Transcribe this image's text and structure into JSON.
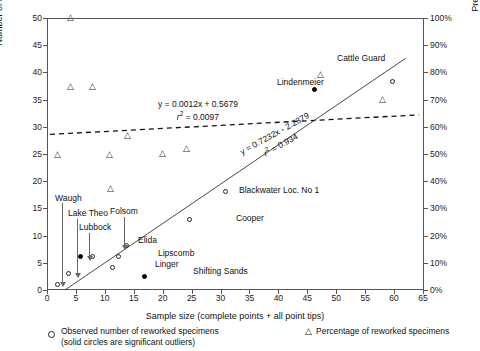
{
  "chart_data": {
    "type": "scatter",
    "title": "",
    "xlabel": "Sample size (complete points + all point tips)",
    "ylabel_left": "Number of reworked specimens",
    "ylabel_right": "Predicted percentage of reworked points",
    "xlim": [
      0,
      65
    ],
    "ylim_left": [
      0,
      50
    ],
    "ylim_right": [
      0,
      100
    ],
    "grid": false,
    "xticks": [
      "0",
      "5",
      "10",
      "15",
      "20",
      "25",
      "30",
      "35",
      "40",
      "45",
      "50",
      "55",
      "60",
      "65"
    ],
    "yticks_left": [
      "0",
      "5",
      "10",
      "15",
      "20",
      "25",
      "30",
      "35",
      "40",
      "45",
      "50"
    ],
    "yticks_right": [
      "0%",
      "10%",
      "20%",
      "30%",
      "40%",
      "50%",
      "60%",
      "70%",
      "80%",
      "90%",
      "100%"
    ],
    "series": [
      {
        "name": "Observed number of reworked specimens",
        "marker": "open-circle",
        "points": [
          {
            "x": 1.9,
            "y": 1.0,
            "label": "Waugh",
            "solid": false
          },
          {
            "x": 3.8,
            "y": 3.1,
            "label": "Lake Theo",
            "solid": false
          },
          {
            "x": 5.8,
            "y": 6.1,
            "label": "Lubbock",
            "solid": true
          },
          {
            "x": 7.8,
            "y": 6.1,
            "label": "Elida",
            "solid": false
          },
          {
            "x": 11.3,
            "y": 4.1,
            "label": "Linger",
            "solid": false
          },
          {
            "x": 12.3,
            "y": 6.2,
            "label": "Lipscomb",
            "solid": false
          },
          {
            "x": 13.7,
            "y": 8.2,
            "label": "Folsom",
            "solid": false
          },
          {
            "x": 16.8,
            "y": 2.5,
            "label": "Shifting Sands",
            "solid": true
          },
          {
            "x": 24.7,
            "y": 13.0,
            "label": "Cooper",
            "solid": false
          },
          {
            "x": 30.9,
            "y": 18.1,
            "label": "Blackwater Loc. No 1",
            "solid": false
          },
          {
            "x": 46.2,
            "y": 36.8,
            "label": "Lindenmeier",
            "solid": true
          },
          {
            "x": 59.8,
            "y": 38.3,
            "label": "Cattle Guard",
            "solid": false
          }
        ]
      },
      {
        "name": "Percentage of reworked specimens",
        "marker": "open-triangle",
        "points": [
          {
            "x": 4.0,
            "y": 50.0
          },
          {
            "x": 4.0,
            "y": 37.4
          },
          {
            "x": 7.8,
            "y": 37.4
          },
          {
            "x": 1.9,
            "y": 24.9
          },
          {
            "x": 10.8,
            "y": 24.9
          },
          {
            "x": 10.9,
            "y": 18.6
          },
          {
            "x": 13.9,
            "y": 28.4
          },
          {
            "x": 24.2,
            "y": 26.0
          },
          {
            "x": 20.0,
            "y": 25.0
          },
          {
            "x": 47.2,
            "y": 39.6
          },
          {
            "x": 58.0,
            "y": 35.0
          }
        ]
      }
    ],
    "trendlines": [
      {
        "name": "percentage-trend",
        "style": "dashed",
        "equation": "y = 0.0012x + 0.5679",
        "r2_label": "r",
        "r2_sup": "2",
        "r2_value": " = 0.0097",
        "slope": 0.0012,
        "intercept": 0.5679,
        "r2": 0.0097
      },
      {
        "name": "count-trend",
        "style": "solid",
        "equation": "y = 0.7232x - 2.2379",
        "r2_label": "r",
        "r2_sup": "2",
        "r2_value": " = 0.934",
        "slope": 0.7232,
        "intercept": -2.2379,
        "r2": 0.934
      }
    ],
    "annotations": [
      {
        "name": "waugh-label",
        "text": "Waugh"
      },
      {
        "name": "lake-theo-label",
        "text": "Lake Theo"
      },
      {
        "name": "lubbock-label",
        "text": "Lubbock"
      },
      {
        "name": "elida-label",
        "text": "Elida"
      },
      {
        "name": "folsom-label",
        "text": "Folsom"
      },
      {
        "name": "lipscomb-label",
        "text": "Lipscomb"
      },
      {
        "name": "linger-label",
        "text": "Linger"
      },
      {
        "name": "shifting-sands-label",
        "text": "Shifting Sands"
      },
      {
        "name": "cooper-label",
        "text": "Cooper"
      },
      {
        "name": "blackwater-label",
        "text": "Blackwater Loc. No 1"
      },
      {
        "name": "lindenmeier-label",
        "text": "Lindenmeier"
      },
      {
        "name": "cattle-guard-label",
        "text": "Cattle Guard"
      }
    ]
  },
  "axes": {
    "x": {
      "title": "Sample size (complete points + all point tips)",
      "ticks": [
        "0",
        "5",
        "10",
        "15",
        "20",
        "25",
        "30",
        "35",
        "40",
        "45",
        "50",
        "55",
        "60",
        "65"
      ]
    },
    "y_left": {
      "title": "Number of reworked specimens",
      "ticks": [
        "50",
        "45",
        "40",
        "35",
        "30",
        "25",
        "20",
        "15",
        "10",
        "5",
        "0"
      ]
    },
    "y_right": {
      "title": "Predicted percentage of reworked points",
      "ticks": [
        "100%",
        "90%",
        "80%",
        "70%",
        "60%",
        "50%",
        "40%",
        "30%",
        "20%",
        "10%",
        "0%"
      ]
    }
  },
  "equations": {
    "dashed": {
      "line1": "y = 0.0012x + 0.5679",
      "r_symbol": "r",
      "exponent": "2",
      "r_tail": " = 0.0097"
    },
    "solid": {
      "line1": "y = 0.7232x - 2.2379",
      "r_symbol": "r",
      "exponent": "2",
      "r_tail": " = 0.934"
    }
  },
  "point_labels": {
    "waugh": "Waugh",
    "lake_theo": "Lake Theo",
    "lubbock": "Lubbock",
    "elida": "Elida",
    "folsom": "Folsom",
    "lipscomb": "Lipscomb",
    "linger": "Linger",
    "shifting_sands": "Shifting Sands",
    "cooper": "Cooper",
    "blackwater": "Blackwater Loc. No 1",
    "lindenmeier": "Lindenmeier",
    "cattle_guard": "Cattle Guard"
  },
  "legend": {
    "observed_line1": "Observed number of reworked specimens",
    "observed_line2": "(solid circles are significant outliers)",
    "percentage": "Percentage of reworked specimens",
    "triangle_glyph": "△"
  },
  "colors": {
    "axis": "#555555",
    "marker": "#222222",
    "text": "#111111"
  }
}
